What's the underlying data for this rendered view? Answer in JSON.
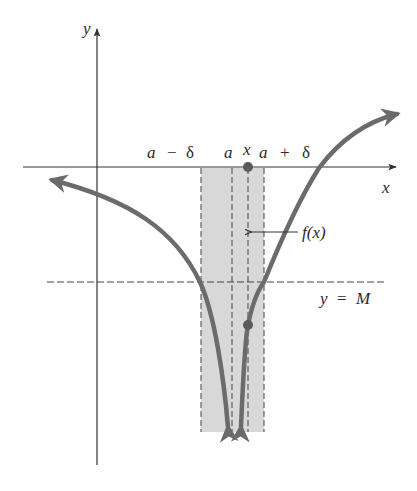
{
  "diagram": {
    "type": "infinite-limit illustration",
    "axes": {
      "x_label": "x",
      "y_label": "y"
    },
    "interval_labels": {
      "left": [
        "a",
        "−",
        "δ"
      ],
      "center": "a",
      "point": "x",
      "right": [
        "a",
        "+",
        "δ"
      ]
    },
    "function_label": "f(x)",
    "horizontal_line_label": [
      "y",
      "=",
      "M"
    ],
    "colors": {
      "curve": "#6b6b6b",
      "shade": "#d8d8d8",
      "axis": "#333333",
      "dash": "#444444",
      "point": "#5a5a5a"
    }
  }
}
